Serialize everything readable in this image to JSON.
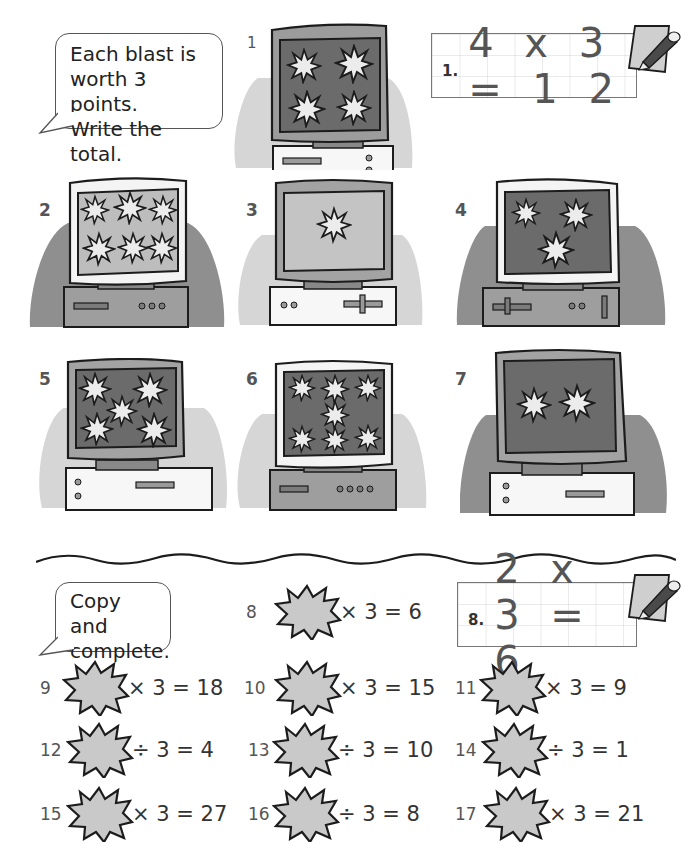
{
  "instructions": {
    "part1": "Each blast is\nworth 3 points.\nWrite the total.",
    "part2": "Copy and\ncomplete."
  },
  "example1": {
    "number": "1.",
    "expression": "4 x 3 = 1 2"
  },
  "example2": {
    "number": "8.",
    "expression": "2 x 3 = 6"
  },
  "computers": [
    {
      "label": "1",
      "blasts": 4,
      "screen_shade": "dark",
      "frame": "grey",
      "case": "white"
    },
    {
      "label": "2",
      "blasts": 6,
      "screen_shade": "light",
      "frame": "white",
      "case": "grey"
    },
    {
      "label": "3",
      "blasts": 1,
      "screen_shade": "light",
      "frame": "grey",
      "case": "white"
    },
    {
      "label": "4",
      "blasts": 3,
      "screen_shade": "dark",
      "frame": "white",
      "case": "grey"
    },
    {
      "label": "5",
      "blasts": 5,
      "screen_shade": "dark",
      "frame": "grey",
      "case": "white"
    },
    {
      "label": "6",
      "blasts": 7,
      "screen_shade": "dark",
      "frame": "white",
      "case": "grey"
    },
    {
      "label": "7",
      "blasts": 2,
      "screen_shade": "dark",
      "frame": "grey",
      "case": "white"
    }
  ],
  "problems": [
    {
      "num": "8",
      "expr": "× 3 = 6"
    },
    {
      "num": "9",
      "expr": "× 3 = 18"
    },
    {
      "num": "10",
      "expr": "× 3 = 15"
    },
    {
      "num": "11",
      "expr": "× 3 = 9"
    },
    {
      "num": "12",
      "expr": "÷ 3 = 4"
    },
    {
      "num": "13",
      "expr": "÷ 3 = 10"
    },
    {
      "num": "14",
      "expr": "÷ 3 = 1"
    },
    {
      "num": "15",
      "expr": "× 3 = 27"
    },
    {
      "num": "16",
      "expr": "÷ 3 = 8"
    },
    {
      "num": "17",
      "expr": "× 3 = 21"
    }
  ],
  "icons": {
    "pencil": "pencil-paper-icon",
    "blast": "starburst-icon"
  },
  "colors": {
    "ink": "#222222",
    "screen_dark": "#6e6e6e",
    "screen_light": "#bdbdbd",
    "shadow": "#b5b5b5",
    "blast_fill": "#e6e6e6",
    "burst_fill": "#c8c8c8"
  }
}
